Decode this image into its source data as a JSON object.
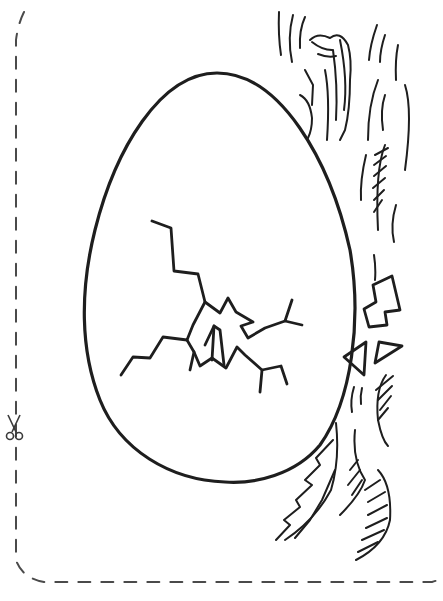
{
  "page": {
    "type": "coloring-page",
    "colors": {
      "background": "#ffffff",
      "ink": "#1e1e1e",
      "cut_line": "#4a4a4a"
    }
  },
  "elements": {
    "cut_border": {
      "icon": "scissors-icon",
      "style": "dashed"
    },
    "egg": {
      "label": "egg"
    },
    "crack": {
      "label": "crack"
    },
    "shell_fragments": {
      "count": 3
    },
    "straw": {
      "label": "straw"
    }
  }
}
